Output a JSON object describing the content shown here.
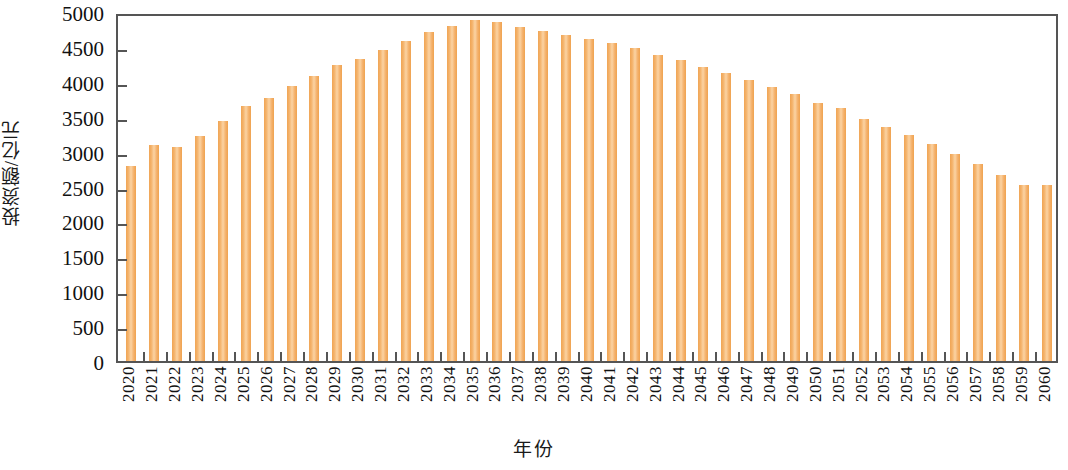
{
  "chart_data": {
    "type": "bar",
    "title": "",
    "xlabel": "年份",
    "ylabel": "投资额/亿元",
    "ylim": [
      0,
      5000
    ],
    "y_ticks": [
      0,
      500,
      1000,
      1500,
      2000,
      2500,
      3000,
      3500,
      4000,
      4500,
      5000
    ],
    "y_tick_labels": [
      "0",
      "500",
      "1000",
      "1500",
      "2000",
      "2500",
      "3000",
      "3500",
      "4000",
      "4500",
      "5000"
    ],
    "grid": false,
    "legend": null,
    "bar_color": "#F4B06A",
    "axis_color": "#555555",
    "categories": [
      "2020",
      "2021",
      "2022",
      "2023",
      "2024",
      "2025",
      "2026",
      "2027",
      "2028",
      "2029",
      "2030",
      "2031",
      "2032",
      "2033",
      "2034",
      "2035",
      "2036",
      "2037",
      "2038",
      "2039",
      "2040",
      "2041",
      "2042",
      "2043",
      "2044",
      "2045",
      "2046",
      "2047",
      "2048",
      "2049",
      "2050",
      "2051",
      "2052",
      "2053",
      "2054",
      "2055",
      "2056",
      "2057",
      "2058",
      "2059",
      "2060"
    ],
    "values": [
      2800,
      3090,
      3060,
      3230,
      3440,
      3650,
      3770,
      3940,
      4080,
      4240,
      4330,
      4450,
      4580,
      4710,
      4800,
      4880,
      4850,
      4790,
      4730,
      4670,
      4620,
      4550,
      4490,
      4390,
      4310,
      4210,
      4120,
      4030,
      3920,
      3820,
      3700,
      3620,
      3470,
      3350,
      3240,
      3110,
      2960,
      2820,
      2670,
      2520,
      2520
    ]
  }
}
